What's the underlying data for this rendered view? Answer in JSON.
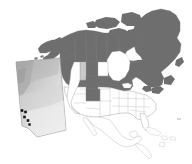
{
  "figure": {
    "title": "North America map with Alberta inset",
    "type": "choropleth-map",
    "background_color": "#ffffff",
    "width": 192,
    "height": 164
  },
  "legend": {
    "visible": false,
    "entries": [
      {
        "label": "Highlighted region",
        "color": "#6e6e6e"
      },
      {
        "label": "Secondary highlight",
        "color": "#c8c8c8"
      },
      {
        "label": "Unhighlighted region",
        "color": "#ffffff"
      },
      {
        "label": "Sampling site",
        "color": "#111111"
      }
    ]
  },
  "colors": {
    "dark_fill": "#6e6e6e",
    "mid_fill": "#9a9a9a",
    "light_fill": "#c9c9c9",
    "pale_fill": "#dcdcdc",
    "white_fill": "#ffffff",
    "border": "#8f8f8f",
    "border_light": "#b5b5b5",
    "dot": "#131313",
    "inset_border": "#9b9b9b",
    "inset_grad_dark": "#a9a9a9",
    "inset_grad_light": "#ececec"
  },
  "main_map": {
    "name": "north-america",
    "regions": [
      {
        "name": "Greenland",
        "fill": "dark_fill"
      },
      {
        "name": "Alaska",
        "fill": "dark_fill"
      },
      {
        "name": "Yukon",
        "fill": "dark_fill"
      },
      {
        "name": "Northwest Territories",
        "fill": "dark_fill"
      },
      {
        "name": "Nunavut",
        "fill": "dark_fill"
      },
      {
        "name": "British Columbia",
        "fill": "dark_fill"
      },
      {
        "name": "Alberta",
        "fill": "dark_fill"
      },
      {
        "name": "Saskatchewan",
        "fill": "dark_fill"
      },
      {
        "name": "Manitoba",
        "fill": "dark_fill"
      },
      {
        "name": "Ontario",
        "fill": "dark_fill"
      },
      {
        "name": "Quebec",
        "fill": "dark_fill"
      },
      {
        "name": "Newfoundland and Labrador",
        "fill": "dark_fill"
      },
      {
        "name": "New Brunswick",
        "fill": "dark_fill"
      },
      {
        "name": "Nova Scotia",
        "fill": "dark_fill"
      },
      {
        "name": "Montana",
        "fill": "dark_fill"
      },
      {
        "name": "Idaho",
        "fill": "light_fill"
      },
      {
        "name": "Wyoming",
        "fill": "dark_fill"
      },
      {
        "name": "Colorado",
        "fill": "dark_fill"
      },
      {
        "name": "North Dakota",
        "fill": "white_fill"
      },
      {
        "name": "South Dakota",
        "fill": "white_fill"
      },
      {
        "name": "Nebraska",
        "fill": "white_fill"
      },
      {
        "name": "Utah",
        "fill": "white_fill"
      },
      {
        "name": "Contiguous United States (other)",
        "fill": "white_fill"
      },
      {
        "name": "Mexico",
        "fill": "white_fill"
      },
      {
        "name": "Central America",
        "fill": "white_fill"
      },
      {
        "name": "Caribbean islands",
        "fill": "white_fill"
      }
    ]
  },
  "inset_map": {
    "name": "alberta-inset",
    "region": "Alberta",
    "border_visible": true,
    "shading": "gradient",
    "points": [
      {
        "id": 1,
        "x": 22.0,
        "y": 110.5
      },
      {
        "id": 2,
        "x": 25.5,
        "y": 112.0
      },
      {
        "id": 3,
        "x": 24.5,
        "y": 117.0
      },
      {
        "id": 4,
        "x": 28.0,
        "y": 120.5
      },
      {
        "id": 5,
        "x": 29.5,
        "y": 124.5
      }
    ]
  },
  "chart_data": {
    "type": "heatmap",
    "title": "North America map with Alberta inset",
    "xlabel": "",
    "ylabel": "",
    "categories": [
      "Greenland",
      "Alaska",
      "Yukon",
      "Northwest Territories",
      "Nunavut",
      "British Columbia",
      "Alberta",
      "Saskatchewan",
      "Manitoba",
      "Ontario",
      "Quebec",
      "Newfoundland and Labrador",
      "Montana",
      "Idaho",
      "Wyoming",
      "Colorado",
      "Other US states",
      "Mexico"
    ],
    "values": [
      1,
      1,
      1,
      1,
      1,
      1,
      1,
      1,
      1,
      1,
      1,
      1,
      1,
      0.5,
      1,
      1,
      0,
      0
    ],
    "series": [
      {
        "name": "Region shading level",
        "values": [
          1,
          1,
          1,
          1,
          1,
          1,
          1,
          1,
          1,
          1,
          1,
          1,
          1,
          0.5,
          1,
          1,
          0,
          0
        ]
      }
    ],
    "legend_position": "none",
    "grid": false
  }
}
